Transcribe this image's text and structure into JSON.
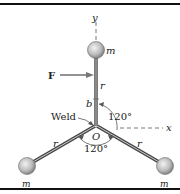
{
  "diagram": {
    "labels": {
      "y_axis": "y",
      "x_axis": "x",
      "force": "F",
      "mass_top": "m",
      "mass_left": "m",
      "mass_right": "m",
      "arm_top": "r",
      "arm_left": "r",
      "arm_right": "r",
      "offset": "b",
      "weld": "Weld",
      "origin": "O",
      "angle_upper": "120°",
      "angle_lower": "120°"
    },
    "colors": {
      "rod": "#555555",
      "ball": "#bdbdbd",
      "rule": "#111111",
      "dashed": "#777777"
    }
  }
}
